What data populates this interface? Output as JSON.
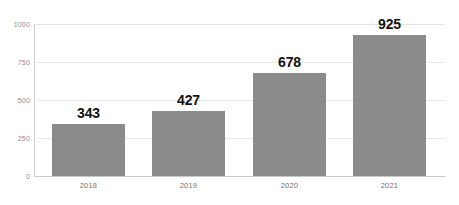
{
  "chart_data": {
    "type": "bar",
    "title": "",
    "subtitle": "",
    "xlabel": "",
    "ylabel": "",
    "categories": [
      "2018",
      "2019",
      "2020",
      "2021"
    ],
    "values": [
      343,
      427,
      678,
      925
    ],
    "data_labels": [
      "343",
      "427",
      "678",
      "925"
    ],
    "ylim": [
      0,
      1000
    ],
    "y_ticks": [
      1000,
      750,
      500,
      250,
      0
    ],
    "y_tick_labels": [
      "1000",
      "750",
      "500",
      "250",
      "0"
    ],
    "grid": true,
    "grid_axis": "y",
    "legend": false,
    "legend_position": "none",
    "series": [
      {
        "name": "",
        "values": [
          343,
          427,
          678,
          925
        ],
        "color": "#8b8b8b"
      }
    ]
  },
  "colors": {
    "bar": "#8b8b8b",
    "gridline": "#e9e9e9",
    "axis": "#c9c9c9",
    "data_label_text": "#111111",
    "tick_text": "#8d8d8d",
    "category_text": "#6f6f6f",
    "background": "#ffffff"
  }
}
